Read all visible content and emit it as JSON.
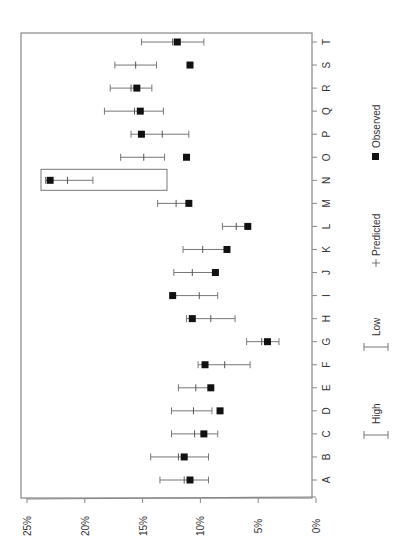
{
  "chart_data": {
    "type": "scatter",
    "orientation": "rotated-90-clockwise",
    "title": "",
    "xlabel": "",
    "ylabel": "",
    "value_axis": {
      "range": [
        0,
        25
      ],
      "ticks": [
        "0%",
        "5%",
        "10%",
        "15%",
        "20%",
        "25%"
      ],
      "tick_values": [
        0,
        5,
        10,
        15,
        20,
        25
      ]
    },
    "categories": [
      "A",
      "B",
      "C",
      "D",
      "E",
      "F",
      "G",
      "H",
      "I",
      "J",
      "K",
      "L",
      "M",
      "N",
      "O",
      "P",
      "Q",
      "R",
      "S",
      "T"
    ],
    "series": [
      {
        "name": "Observed",
        "marker": "square",
        "values": [
          10.9,
          11.4,
          9.7,
          8.3,
          9.1,
          9.6,
          4.2,
          10.7,
          12.4,
          8.7,
          7.7,
          5.9,
          11.0,
          23.0,
          11.2,
          15.1,
          15.2,
          15.5,
          10.9,
          12.0
        ]
      },
      {
        "name": "Predicted",
        "marker": "plus",
        "values": [
          11.4,
          11.9,
          10.5,
          10.6,
          10.4,
          7.9,
          4.7,
          9.1,
          10.1,
          10.7,
          9.8,
          6.9,
          12.1,
          21.5,
          14.9,
          13.3,
          15.7,
          16.0,
          15.6,
          12.4
        ]
      },
      {
        "name": "High",
        "marker": "errorbar-cap",
        "values": [
          13.5,
          14.3,
          12.5,
          12.5,
          11.9,
          10.2,
          6.0,
          11.2,
          12.4,
          12.3,
          11.5,
          8.1,
          13.7,
          23.4,
          16.9,
          16.0,
          18.3,
          17.8,
          17.4,
          15.1
        ]
      },
      {
        "name": "Low",
        "marker": "errorbar-cap",
        "values": [
          9.3,
          9.3,
          8.5,
          9.0,
          9.1,
          5.7,
          3.2,
          7.0,
          8.5,
          8.7,
          7.7,
          5.9,
          11.0,
          19.3,
          13.1,
          11.0,
          13.2,
          14.2,
          13.8,
          9.7
        ]
      }
    ],
    "annotations": [
      {
        "type": "highlight-box",
        "category": "N"
      }
    ],
    "legend": {
      "position": "right",
      "entries": [
        "Observed",
        "Predicted",
        "Low",
        "High"
      ]
    },
    "grid": false
  },
  "legend": {
    "observed": "Observed",
    "predicted": "Predicted",
    "low": "Low",
    "high": "High"
  },
  "colors": {
    "marker": "#111111",
    "errorbar": "#777777",
    "frame": "#888888",
    "text": "#333333"
  }
}
